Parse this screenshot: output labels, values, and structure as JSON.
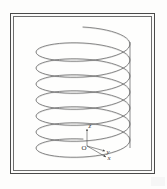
{
  "figure": {
    "kind": "line-drawing",
    "background_color": "#fdfdfc",
    "ink_color": "#5a5a5a",
    "frame": {
      "style": "double-rule rectangle",
      "outer_color": "#4a4a4a",
      "inner_color": "#6e6e6e"
    }
  },
  "coil": {
    "turns": 7,
    "center_x": 70,
    "top_y": 24,
    "bottom_y": 140,
    "radius_x": 47,
    "radius_y": 13,
    "pitch": 16,
    "lead_line": {
      "present": true,
      "side": "right",
      "x": 117,
      "top_y": 26,
      "bottom_y": 132
    }
  },
  "axes": {
    "origin": {
      "x": 74,
      "y": 130
    },
    "labels": {
      "z": "z",
      "y": "y",
      "x": "x",
      "origin": "O"
    },
    "z_axis": {
      "dx": 0,
      "dy": -17
    },
    "y_axis": {
      "dx": 18,
      "dy": 5
    },
    "x_axis": {
      "dx": 19,
      "dy": 11
    }
  }
}
